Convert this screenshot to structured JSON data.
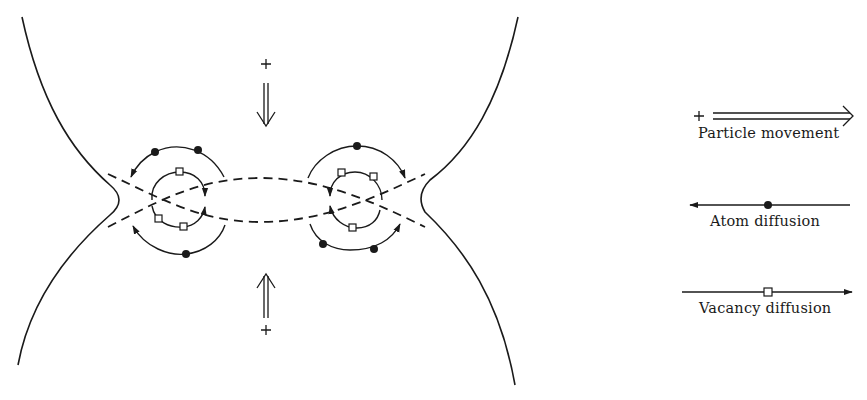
{
  "diagram": {
    "type": "sintering-neck-mass-transport",
    "colors": {
      "ink": "#1a1a1a",
      "background": "#ffffff"
    },
    "particles": {
      "count": 2,
      "symbol_top": "+",
      "symbol_bottom": "+"
    },
    "arrows": {
      "top": {
        "direction": "down",
        "style": "double-line",
        "marker": "+"
      },
      "bottom": {
        "direction": "up",
        "style": "double-line",
        "marker": "+"
      }
    },
    "neck_regions": [
      {
        "side": "left",
        "atom_markers": 3,
        "vacancy_markers": 3
      },
      {
        "side": "right",
        "atom_markers": 3,
        "vacancy_markers": 3
      }
    ]
  },
  "legend": {
    "items": [
      {
        "id": "particle-movement",
        "label": "Particle movement",
        "symbol": "double-arrow-right",
        "marker": "+"
      },
      {
        "id": "atom-diffusion",
        "label": "Atom diffusion",
        "symbol": "arrow-left-with-dot"
      },
      {
        "id": "vacancy-diffusion",
        "label": "Vacancy diffusion",
        "symbol": "arrow-right-with-square"
      }
    ]
  }
}
